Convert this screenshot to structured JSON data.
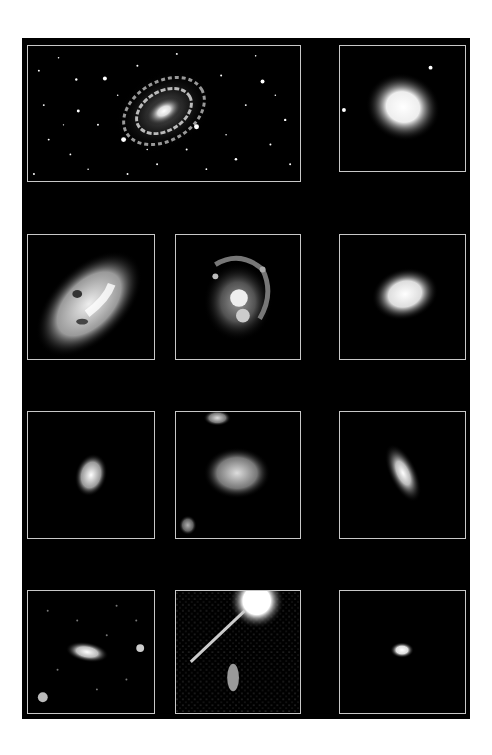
{
  "figure": {
    "background": "#000000",
    "frame_color": "#c8c8c8",
    "layout": "4 rows x 3 columns grid of galaxy images; top-left spans two columns",
    "panels": [
      {
        "id": "p1",
        "subject": "large barred spiral galaxy in a dense star field",
        "row": 1,
        "col": "1-2"
      },
      {
        "id": "p2",
        "subject": "smooth elliptical galaxy with two point sources",
        "row": 1,
        "col": 3
      },
      {
        "id": "p3",
        "subject": "large inclined spiral galaxy with dust lanes",
        "row": 2,
        "col": 1
      },
      {
        "id": "p4",
        "subject": "face-on spiral with knotty arms",
        "row": 2,
        "col": 2
      },
      {
        "id": "p5",
        "subject": "grainy elliptical galaxy",
        "row": 2,
        "col": 3
      },
      {
        "id": "p6",
        "subject": "small compact spiral",
        "row": 3,
        "col": 1
      },
      {
        "id": "p7",
        "subject": "irregular clumpy galaxy",
        "row": 3,
        "col": 2
      },
      {
        "id": "p8",
        "subject": "inclined disk galaxy",
        "row": 3,
        "col": 3
      },
      {
        "id": "p9",
        "subject": "faint elongated galaxy with neighbors in noisy field",
        "row": 4,
        "col": 1
      },
      {
        "id": "p10",
        "subject": "bright saturated star with diffraction spike and faint galaxy",
        "row": 4,
        "col": 2
      },
      {
        "id": "p11",
        "subject": "tiny compact distant galaxy",
        "row": 4,
        "col": 3
      }
    ]
  }
}
